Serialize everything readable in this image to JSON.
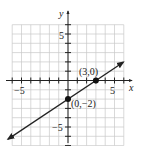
{
  "chart_data": {
    "type": "line",
    "title": "",
    "xlabel": "x",
    "ylabel": "y",
    "xlim": [
      -6,
      6
    ],
    "ylim": [
      -7,
      6
    ],
    "grid": true,
    "x_tick_labels": [
      {
        "value": -5,
        "label": "-5"
      },
      {
        "value": 5,
        "label": "5"
      }
    ],
    "y_tick_labels": [
      {
        "value": 5,
        "label": "5"
      },
      {
        "value": -5,
        "label": "-5"
      }
    ],
    "series": [
      {
        "name": "line",
        "equation": "y = (2/3)x - 2",
        "slope": 0.6667,
        "intercept": -2,
        "x_range": [
          -6.45,
          5.95
        ],
        "arrows": "both"
      }
    ],
    "points": [
      {
        "x": 3,
        "y": 0,
        "label": "(3,0)"
      },
      {
        "x": 0,
        "y": -2,
        "label": "(0,−2)"
      }
    ]
  },
  "labels": {
    "x_axis": "x",
    "y_axis": "y",
    "x_neg5": "−5",
    "x_pos5": "5",
    "y_pos5": "5",
    "y_neg5": "−5",
    "pt1": "(3,0)",
    "pt2": "(0,−2)"
  },
  "colors": {
    "grid": "#c8c8c8",
    "axis": "#222222",
    "line": "#222222",
    "point": "#111111"
  }
}
